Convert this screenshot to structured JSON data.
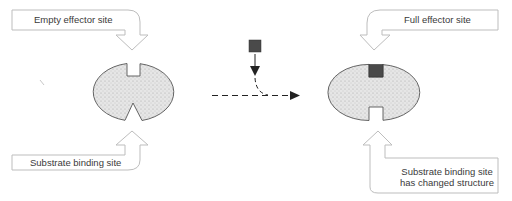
{
  "diagram": {
    "colors": {
      "callout_stroke": "#bdbdbd",
      "enzyme_fill": "#e2e2e2",
      "enzyme_stroke": "#555555",
      "effector_fill": "#4a4a4a",
      "arrow": "#222222",
      "text": "#3a3a3a"
    },
    "left_enzyme": {
      "state": "unbound",
      "callouts": [
        {
          "id": "empty-effector-site",
          "text": "Empty effector site",
          "pointer": "down"
        },
        {
          "id": "substrate-binding-site",
          "text": "Substrate binding site",
          "pointer": "up"
        }
      ]
    },
    "transition": {
      "effector": "effector-molecule (dark square)",
      "arrow": "dashed arrow pointing right"
    },
    "right_enzyme": {
      "state": "effector bound",
      "callouts": [
        {
          "id": "full-effector-site",
          "text": "Full effector site",
          "pointer": "down"
        },
        {
          "id": "changed-substrate-site",
          "line1": "Substrate binding site",
          "line2": "has changed structure",
          "pointer": "up"
        }
      ]
    }
  }
}
